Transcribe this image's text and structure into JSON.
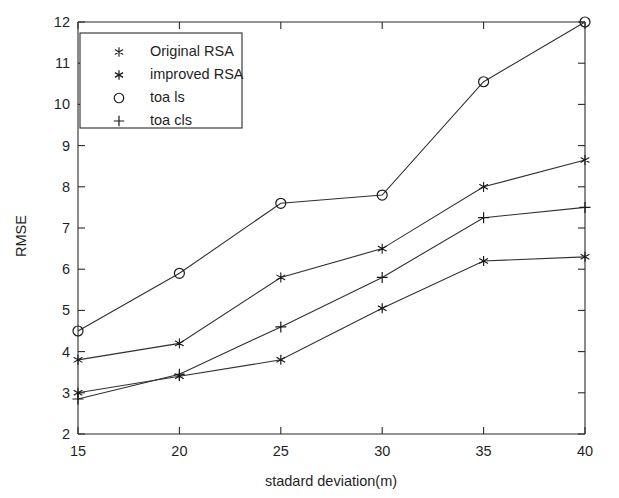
{
  "chart_data": {
    "type": "line",
    "title": "",
    "xlabel": "stadard deviation(m)",
    "ylabel": "RMSE",
    "x": [
      15,
      20,
      25,
      30,
      35,
      40
    ],
    "xticklabels": [
      "15",
      "20",
      "25",
      "30",
      "35",
      "40"
    ],
    "yticklabels": [
      "2",
      "3",
      "4",
      "5",
      "6",
      "7",
      "8",
      "9",
      "10",
      "11",
      "12"
    ],
    "xlim": [
      15,
      40
    ],
    "ylim": [
      2,
      12
    ],
    "grid": false,
    "legend_position": "upper-left",
    "series": [
      {
        "name": "Original RSA",
        "marker": "filled-star",
        "values": [
          3.8,
          4.2,
          5.8,
          6.5,
          8.0,
          8.65
        ]
      },
      {
        "name": "improved RSA",
        "marker": "open-star",
        "values": [
          3.0,
          3.4,
          3.8,
          5.05,
          6.2,
          6.3
        ]
      },
      {
        "name": "toa ls",
        "marker": "circle",
        "values": [
          4.5,
          5.9,
          7.6,
          7.8,
          10.55,
          12.0
        ]
      },
      {
        "name": "toa cls",
        "marker": "plus",
        "values": [
          2.85,
          3.45,
          4.6,
          5.8,
          7.25,
          7.5
        ]
      }
    ]
  },
  "legend": {
    "entries": [
      {
        "label": "Original RSA",
        "marker": "filled-star"
      },
      {
        "label": "improved RSA",
        "marker": "open-star"
      },
      {
        "label": "toa ls",
        "marker": "circle"
      },
      {
        "label": "toa cls",
        "marker": "plus"
      }
    ]
  },
  "axes": {
    "x_title": "stadard deviation(m)",
    "y_title": "RMSE"
  }
}
